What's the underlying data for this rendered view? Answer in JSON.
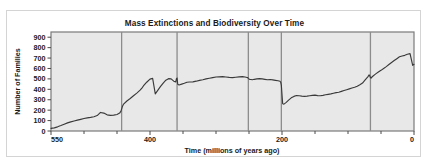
{
  "figure": {
    "background_color": "#ffffff",
    "card_border_color": "#d4d4d4"
  },
  "chart_data": {
    "type": "line",
    "title": "Mass Extinctions and Biodiversity Over Time",
    "xlabel": "Time (millions of years ago)",
    "ylabel": "Number of Families",
    "xlim": [
      550,
      0
    ],
    "ylim": [
      0,
      950
    ],
    "x_reversed": true,
    "grid": false,
    "legend": null,
    "plot_bg_color": "#e8e8e8",
    "line_color": "#3a3a3a",
    "marker_line_color": "#8c8c8c",
    "xticks_labeled": [
      550,
      400,
      200,
      0
    ],
    "xticks_minor": [
      500,
      450,
      350,
      300,
      250,
      150,
      100,
      50
    ],
    "yticks": [
      0,
      100,
      200,
      300,
      400,
      500,
      600,
      700,
      800,
      900
    ],
    "extinction_events": [
      443,
      359,
      251,
      201,
      66
    ],
    "x": [
      550,
      545,
      540,
      535,
      530,
      525,
      520,
      515,
      510,
      505,
      500,
      495,
      490,
      485,
      480,
      475,
      470,
      465,
      460,
      455,
      450,
      446,
      444,
      443,
      442,
      440,
      435,
      430,
      425,
      420,
      415,
      412,
      410,
      405,
      400,
      396,
      392,
      388,
      384,
      380,
      376,
      372,
      368,
      364,
      361,
      360,
      359,
      358,
      356,
      352,
      348,
      344,
      340,
      335,
      330,
      325,
      320,
      315,
      310,
      305,
      300,
      295,
      290,
      285,
      280,
      275,
      270,
      265,
      260,
      256,
      253,
      252,
      251,
      250,
      249,
      247,
      245,
      242,
      238,
      234,
      230,
      226,
      222,
      218,
      214,
      210,
      206,
      203,
      202,
      201,
      200,
      199,
      197,
      194,
      190,
      186,
      182,
      178,
      174,
      170,
      166,
      162,
      158,
      154,
      150,
      146,
      142,
      138,
      134,
      130,
      126,
      122,
      118,
      114,
      110,
      106,
      102,
      98,
      94,
      90,
      86,
      82,
      78,
      74,
      70,
      68,
      67,
      66,
      65,
      64,
      62,
      58,
      54,
      50,
      46,
      42,
      38,
      34,
      30,
      26,
      22,
      18,
      14,
      10,
      6,
      2,
      0
    ],
    "y": [
      25,
      30,
      40,
      52,
      65,
      78,
      88,
      96,
      104,
      112,
      120,
      126,
      131,
      137,
      148,
      178,
      172,
      155,
      150,
      152,
      158,
      172,
      190,
      210,
      232,
      258,
      288,
      312,
      338,
      364,
      392,
      414,
      432,
      468,
      498,
      505,
      356,
      392,
      428,
      460,
      488,
      502,
      500,
      478,
      470,
      500,
      508,
      448,
      442,
      450,
      458,
      468,
      470,
      472,
      478,
      486,
      492,
      500,
      506,
      512,
      518,
      520,
      522,
      518,
      514,
      512,
      516,
      520,
      522,
      518,
      514,
      512,
      505,
      500,
      496,
      494,
      492,
      496,
      500,
      502,
      500,
      496,
      492,
      494,
      490,
      486,
      482,
      478,
      468,
      440,
      350,
      262,
      258,
      272,
      296,
      318,
      332,
      340,
      338,
      334,
      332,
      334,
      338,
      342,
      344,
      340,
      338,
      342,
      348,
      352,
      356,
      362,
      368,
      372,
      380,
      388,
      396,
      404,
      412,
      420,
      430,
      444,
      460,
      490,
      520,
      538,
      528,
      512,
      508,
      516,
      528,
      548,
      566,
      582,
      600,
      618,
      638,
      658,
      676,
      694,
      712,
      720,
      726,
      736,
      742,
      630,
      640,
      656,
      672,
      684,
      690,
      700,
      712,
      722,
      730,
      742,
      756,
      772,
      788,
      800,
      812,
      824,
      838,
      852,
      866,
      878,
      888,
      896,
      906,
      914,
      920,
      926,
      930,
      932
    ]
  }
}
